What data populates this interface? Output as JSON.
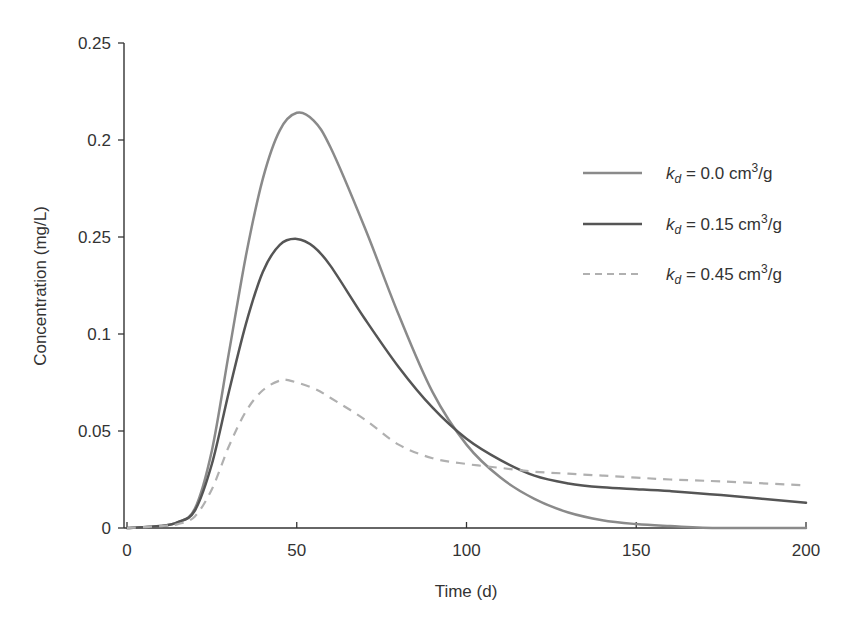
{
  "chart_data": {
    "type": "line",
    "title": "",
    "xlabel": "Time (d)",
    "ylabel": "Concentration (mg/L)",
    "xlim": [
      0,
      200
    ],
    "ylim": [
      0,
      0.25
    ],
    "x_ticks": [
      0,
      50,
      100,
      150,
      200
    ],
    "x_tick_labels": [
      "0",
      "50",
      "100",
      "150",
      "200"
    ],
    "y_ticks": [
      0,
      0.05,
      0.1,
      0.15,
      0.2,
      0.25
    ],
    "y_tick_labels": [
      "0",
      "0.05",
      "0.1",
      "0.25",
      "0.2",
      "0.25"
    ],
    "grid": false,
    "legend_position": "upper right",
    "series": [
      {
        "name": "k_d = 0.0 cm³/g",
        "legend_main": "k",
        "legend_sub": "d",
        "legend_rest": " = 0.0 cm",
        "legend_sup": "3",
        "legend_tail": "/g",
        "style": "solid",
        "color": "#8a8a8a",
        "width": 2.5,
        "x": [
          0,
          10,
          15,
          20,
          25,
          30,
          35,
          40,
          45,
          50,
          55,
          60,
          70,
          80,
          90,
          100,
          110,
          120,
          130,
          140,
          150,
          160,
          175,
          200
        ],
        "values": [
          0,
          0.001,
          0.003,
          0.01,
          0.04,
          0.09,
          0.14,
          0.18,
          0.205,
          0.214,
          0.21,
          0.196,
          0.155,
          0.11,
          0.07,
          0.043,
          0.026,
          0.015,
          0.008,
          0.004,
          0.002,
          0.001,
          0,
          0
        ]
      },
      {
        "name": "k_d = 0.15 cm³/g",
        "legend_main": "k",
        "legend_sub": "d",
        "legend_rest": " = 0.15 cm",
        "legend_sup": "3",
        "legend_tail": "/g",
        "style": "solid",
        "color": "#555555",
        "width": 2.5,
        "x": [
          0,
          10,
          15,
          20,
          25,
          30,
          35,
          40,
          45,
          50,
          55,
          60,
          70,
          80,
          90,
          100,
          110,
          120,
          130,
          140,
          150,
          160,
          175,
          200
        ],
        "values": [
          0,
          0.001,
          0.003,
          0.009,
          0.033,
          0.07,
          0.105,
          0.132,
          0.146,
          0.149,
          0.145,
          0.135,
          0.108,
          0.083,
          0.062,
          0.046,
          0.035,
          0.027,
          0.023,
          0.021,
          0.02,
          0.019,
          0.017,
          0.013
        ]
      },
      {
        "name": "k_d = 0.45 cm³/g",
        "legend_main": "k",
        "legend_sub": "d",
        "legend_rest": " = 0.45 cm",
        "legend_sup": "3",
        "legend_tail": "/g",
        "style": "dashed",
        "color": "#b0b0b0",
        "width": 2.2,
        "x": [
          0,
          10,
          15,
          20,
          25,
          30,
          35,
          40,
          45,
          48,
          55,
          60,
          70,
          80,
          90,
          100,
          110,
          120,
          130,
          140,
          150,
          160,
          175,
          200
        ],
        "values": [
          0,
          0.001,
          0.002,
          0.006,
          0.02,
          0.042,
          0.06,
          0.071,
          0.076,
          0.076,
          0.072,
          0.067,
          0.056,
          0.043,
          0.036,
          0.033,
          0.031,
          0.029,
          0.028,
          0.027,
          0.026,
          0.025,
          0.024,
          0.022
        ]
      }
    ]
  }
}
